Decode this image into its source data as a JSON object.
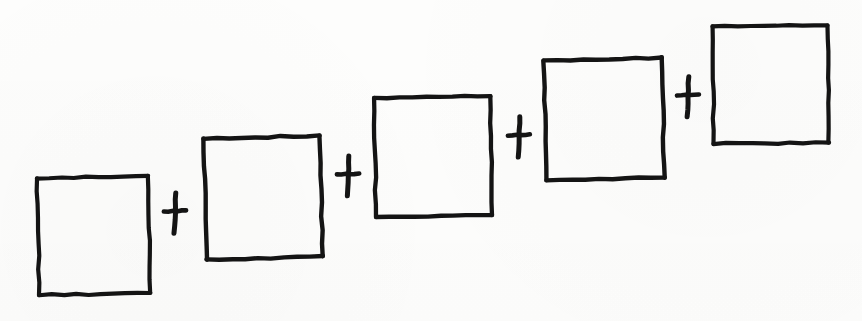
{
  "document": {
    "kind": "hand-drawn-sketch",
    "title": "Sum of five squares",
    "medium": "black ink on white paper",
    "background_color": "#fdfdfc",
    "ink_color": "#141414",
    "canvas": {
      "width": 862,
      "height": 321
    }
  },
  "expression": {
    "operator_symbol": "+",
    "term_count": 5,
    "operator_count": 4,
    "reading": "square + square + square + square + square",
    "arrangement": "ascending staircase from lower-left to upper-right"
  },
  "shapes": [
    {
      "id": "square-1",
      "label": "square",
      "order": 1,
      "x": 38,
      "y": 177,
      "width": 111,
      "height": 117,
      "rotation": -1.2,
      "stroke_width": 4.2
    },
    {
      "id": "square-2",
      "label": "square",
      "order": 2,
      "x": 205,
      "y": 137,
      "width": 116,
      "height": 121,
      "rotation": -1.6,
      "stroke_width": 4.4
    },
    {
      "id": "square-3",
      "label": "square",
      "order": 3,
      "x": 375,
      "y": 97,
      "width": 116,
      "height": 119,
      "rotation": -0.8,
      "stroke_width": 4.3
    },
    {
      "id": "square-4",
      "label": "square",
      "order": 4,
      "x": 545,
      "y": 59,
      "width": 118,
      "height": 120,
      "rotation": -1.4,
      "stroke_width": 4.4
    },
    {
      "id": "square-5",
      "label": "square",
      "order": 5,
      "x": 713,
      "y": 26,
      "width": 115,
      "height": 117,
      "rotation": -0.7,
      "stroke_width": 4.2
    }
  ],
  "operators": [
    {
      "id": "plus-1",
      "symbol": "+",
      "order": 1,
      "between": [
        "square-1",
        "square-2"
      ],
      "cx": 175,
      "cy": 213,
      "arm_half_width": 11,
      "arm_half_height": 20,
      "stroke_width": 5.0
    },
    {
      "id": "plus-2",
      "symbol": "+",
      "order": 2,
      "between": [
        "square-2",
        "square-3"
      ],
      "cx": 348,
      "cy": 176,
      "arm_half_width": 11,
      "arm_half_height": 20,
      "stroke_width": 5.0
    },
    {
      "id": "plus-3",
      "symbol": "+",
      "order": 3,
      "between": [
        "square-3",
        "square-4"
      ],
      "cx": 519,
      "cy": 137,
      "arm_half_width": 11,
      "arm_half_height": 20,
      "stroke_width": 5.0
    },
    {
      "id": "plus-4",
      "symbol": "+",
      "order": 4,
      "between": [
        "square-4",
        "square-5"
      ],
      "cx": 688,
      "cy": 97,
      "arm_half_width": 11,
      "arm_half_height": 20,
      "stroke_width": 5.0
    }
  ]
}
